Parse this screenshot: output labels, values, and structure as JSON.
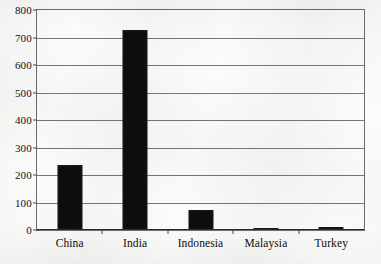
{
  "chart_data": {
    "type": "bar",
    "title": "",
    "subtitle": "",
    "xlabel": "",
    "ylabel": "",
    "categories": [
      "China",
      "India",
      "Indonesia",
      "Malaysia",
      "Turkey"
    ],
    "values": [
      237,
      727,
      73,
      7,
      12
    ],
    "ylim": [
      0,
      800
    ],
    "ytick_step": 100,
    "yticks": [
      "800",
      "700",
      "600",
      "500",
      "400",
      "300",
      "200",
      "100",
      "0"
    ],
    "ytick_values": [
      800,
      700,
      600,
      500,
      400,
      300,
      200,
      100,
      0
    ],
    "grid": true,
    "grid_axis": "y",
    "legend": null,
    "legend_position": "none",
    "series": [
      {
        "name": "",
        "values": [
          237,
          727,
          73,
          7,
          12
        ]
      }
    ],
    "bar_color": "#0d0d0d",
    "grid_color": "#777777",
    "frame_color": "#6d6d6d",
    "background_color": "#fbfbf9",
    "annotations": []
  },
  "ghost_text": {
    "line1": "",
    "line2": "",
    "line3": ""
  }
}
